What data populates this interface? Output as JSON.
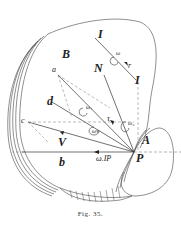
{
  "figure": {
    "caption": "Fig. 35.",
    "labels": {
      "I_top": "I",
      "I_bottom": "I",
      "B": "B",
      "N": "N",
      "a": "a",
      "d": "d",
      "c": "c",
      "V": "V",
      "b": "b",
      "A": "A",
      "P": "P",
      "omega": "ω",
      "r": "r",
      "omega_1": "ω₁",
      "omega_2": "ω₂",
      "omega_v": "ωv",
      "tau": "τ",
      "omega_IP": "ω.IP"
    }
  }
}
